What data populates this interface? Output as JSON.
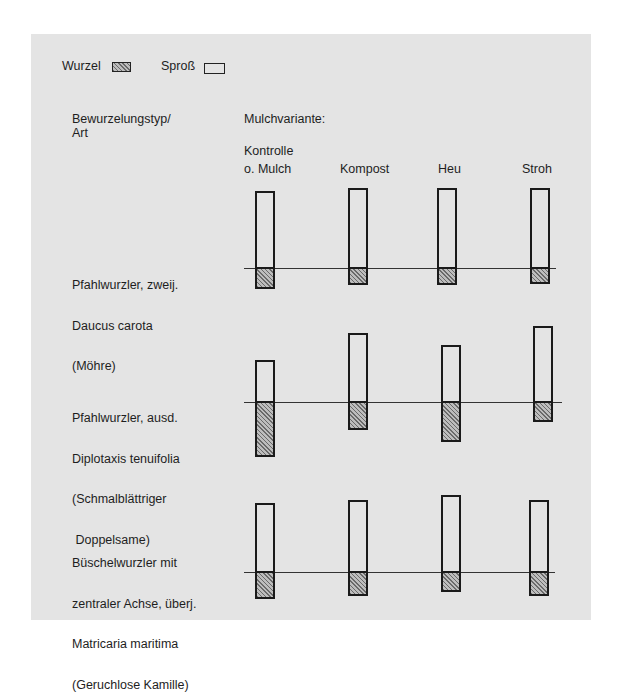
{
  "legend": {
    "root_label": "Wurzel",
    "shoot_label": "Sproß"
  },
  "headers": {
    "row_header_line1": "Bewurzelungstyp/",
    "row_header_line2": "Art",
    "column_header": "Mulchvariante:"
  },
  "columns": [
    {
      "line1": "Kontrolle",
      "line2": "o. Mulch"
    },
    {
      "line1": "",
      "line2": "Kompost"
    },
    {
      "line1": "",
      "line2": "Heu"
    },
    {
      "line1": "",
      "line2": "Stroh"
    }
  ],
  "rows": [
    {
      "lines": [
        "Pfahlwurzler, zweij.",
        "Daucus carota",
        "(Möhre)"
      ]
    },
    {
      "lines": [
        "Pfahlwurzler, ausd.",
        "Diplotaxis tenuifolia",
        "(Schmalblättriger",
        " Doppelsame)"
      ]
    },
    {
      "lines": [
        "Büschelwurzler mit",
        "zentraler Achse, überj.",
        "Matricaria maritima",
        "(Geruchlose Kamille)"
      ]
    }
  ],
  "colors": {
    "panel_background": "#e4e4e4",
    "outline": "#1a1a1a",
    "root_hatch": "#6a6a6a"
  },
  "chart_data": {
    "type": "bar",
    "title": "",
    "xlabel": "Mulchvariante",
    "ylabel": "Bewurzelungstyp/Art",
    "categories": [
      "Kontrolle o. Mulch",
      "Kompost",
      "Heu",
      "Stroh"
    ],
    "legend": [
      "Wurzel (hatched)",
      "Sproß (open)"
    ],
    "grid": false,
    "groups": [
      {
        "name": "Pfahlwurzler, zweij. Daucus carota (Möhre)",
        "series": [
          {
            "name": "Sproß",
            "values": [
              77,
              80,
              80,
              80
            ]
          },
          {
            "name": "Wurzel",
            "values": [
              20,
              16,
              16,
              15
            ]
          }
        ]
      },
      {
        "name": "Pfahlwurzler, ausd. Diplotaxis tenuifolia (Schmalblättriger Doppelsame)",
        "series": [
          {
            "name": "Sproß",
            "values": [
              42,
              69,
              57,
              76
            ]
          },
          {
            "name": "Wurzel",
            "values": [
              54,
              27,
              39,
              19
            ]
          }
        ]
      },
      {
        "name": "Büschelwurzler mit zentraler Achse, überj. Matricaria maritima (Geruchlose Kamille)",
        "series": [
          {
            "name": "Sproß",
            "values": [
              69,
              72,
              77,
              72
            ]
          },
          {
            "name": "Wurzel",
            "values": [
              26,
              23,
              19,
              23
            ]
          }
        ]
      }
    ]
  }
}
